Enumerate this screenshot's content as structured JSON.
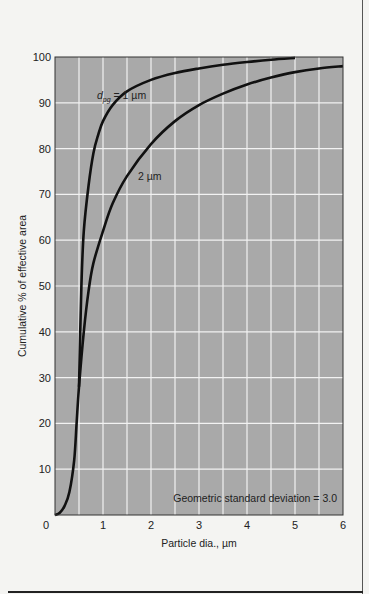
{
  "chart_data": {
    "type": "line",
    "title": "",
    "xlabel": "Particle dia., µm",
    "ylabel": "Cumulative % of effective area",
    "xlim": [
      0,
      6
    ],
    "ylim": [
      0,
      100
    ],
    "x_ticks": [
      "0",
      "1",
      "2",
      "3",
      "4",
      "5",
      "6"
    ],
    "y_ticks": [
      "10",
      "20",
      "30",
      "40",
      "50",
      "60",
      "70",
      "80",
      "90",
      "100"
    ],
    "grid": true,
    "grid_minor_x_step": 0.5,
    "grid_y_step": 10,
    "plot_background": "#a9a9a9",
    "grid_color": "#f2f2f2",
    "line_color": "#111111",
    "series": [
      {
        "name": "d_pg = 1 µm",
        "label_main": "d",
        "label_sub": "pg",
        "label_rest": " = 1 µm",
        "points": [
          [
            0.5,
            28
          ],
          [
            0.55,
            50
          ],
          [
            0.6,
            62
          ],
          [
            0.7,
            72
          ],
          [
            0.8,
            79
          ],
          [
            0.9,
            83
          ],
          [
            1.0,
            86
          ],
          [
            1.2,
            89.5
          ],
          [
            1.5,
            92.5
          ],
          [
            2.0,
            95
          ],
          [
            2.5,
            96.5
          ],
          [
            3.0,
            97.5
          ],
          [
            3.5,
            98.3
          ],
          [
            4.0,
            98.9
          ],
          [
            4.5,
            99.4
          ],
          [
            5.0,
            99.8
          ]
        ]
      },
      {
        "name": "2 µm",
        "label": "2 µm",
        "points": [
          [
            0.0,
            0
          ],
          [
            0.1,
            0.5
          ],
          [
            0.2,
            2
          ],
          [
            0.3,
            5
          ],
          [
            0.4,
            12
          ],
          [
            0.45,
            20
          ],
          [
            0.5,
            28
          ],
          [
            0.6,
            40
          ],
          [
            0.7,
            49
          ],
          [
            0.8,
            55
          ],
          [
            1.0,
            62
          ],
          [
            1.2,
            68
          ],
          [
            1.5,
            74
          ],
          [
            2.0,
            81
          ],
          [
            2.5,
            86
          ],
          [
            3.0,
            89.5
          ],
          [
            3.5,
            92
          ],
          [
            4.0,
            94
          ],
          [
            4.5,
            95.5
          ],
          [
            5.0,
            96.7
          ],
          [
            5.5,
            97.5
          ],
          [
            6.0,
            98
          ]
        ]
      }
    ],
    "annotations": [
      "Geometric standard deviation = 3.0"
    ]
  }
}
